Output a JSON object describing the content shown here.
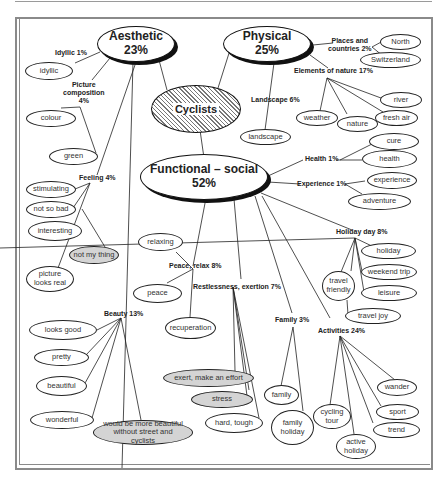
{
  "diagram": {
    "center": {
      "label": "Cyclists"
    },
    "categories": [
      {
        "id": "aesthetic",
        "title": "Aesthetic",
        "percent": "23%"
      },
      {
        "id": "physical",
        "title": "Physical",
        "percent": "25%"
      },
      {
        "id": "functional",
        "title": "Functional – social",
        "percent": "52%"
      }
    ],
    "subcategories": {
      "idyllic": "Idyllic 1%",
      "picture_composition": "Picture composition 4%",
      "picture_composition_l1": "Picture",
      "picture_composition_l2": "composition",
      "picture_composition_l3": "4%",
      "feeling": "Feeling 4%",
      "beauty": "Beauty 13%",
      "places": "Places and countries 2%",
      "places_l1": "Places and",
      "places_l2": "countries 2%",
      "elements": "Elements of nature 17%",
      "landscape": "Landscape 6%",
      "health": "Health 1%",
      "experience": "Experience 1%",
      "holiday_day": "Holiday day 8%",
      "peace": "Peace, relax 8%",
      "restlessness": "Restlessness, exertion 7%",
      "family": "Family 3%",
      "activities": "Activities 24%"
    },
    "leaves": {
      "idyllic": "idyllic",
      "colour": "colour",
      "green": "green",
      "stimulating": "stimulating",
      "not_so_bad": "not so bad",
      "interesting": "interesting",
      "not_my_thing": "not my thing",
      "picture_looks_real": "picture looks real",
      "looks_good": "looks good",
      "pretty": "pretty",
      "beautiful": "beautiful",
      "wonderful": "wonderful",
      "more_beautiful": "would be more beautiful without street and cyclists",
      "north": "North",
      "switzerland": "Switzerland",
      "river": "river",
      "fresh_air": "fresh air",
      "weather": "weather",
      "nature": "nature",
      "landscape": "landscape",
      "cure": "cure",
      "health": "health",
      "experience": "experience",
      "adventure": "adventure",
      "holiday": "holiday",
      "weekend_trip": "weekend trip",
      "travel_friendly": "travel friendly",
      "leisure": "leisure",
      "travel_joy": "travel joy",
      "relaxing": "relaxing",
      "peace": "peace",
      "recuperation": "recuperation",
      "exert": "exert, make an effort",
      "stress": "stress",
      "hard_tough": "hard, tough",
      "family": "family",
      "family_holiday": "family holiday",
      "wander": "wander",
      "cycling_tour": "cycling tour",
      "sport": "sport",
      "trend": "trend",
      "active_holiday": "active holiday"
    },
    "colors": {
      "negative_fill": "#d4d4d4",
      "line": "#222222",
      "frame": "#8a8a8a"
    }
  }
}
